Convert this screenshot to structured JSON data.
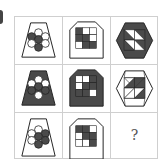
{
  "puzzle": {
    "type": "3x3 figure reasoning matrix",
    "colors": {
      "dark": "#4a4a4a",
      "light": "#ffffff",
      "stroke": "#222222",
      "grid_line": "#cfcfcf"
    },
    "rows": [
      [
        {
          "shape": "trapezoid",
          "outer_fill": "light",
          "inner": "flower-7-circles",
          "dark_circles": [
            "top-left",
            "center",
            "bottom-left"
          ]
        },
        {
          "shape": "house-pentagon",
          "outer_fill": "light",
          "inner": "3x3-squares",
          "dark_cells": [
            0,
            3,
            4,
            7
          ]
        },
        {
          "shape": "hexagon",
          "outer_fill": "dark",
          "inner": "square-of-triangles",
          "dark_triangles": "mixed"
        }
      ],
      [
        {
          "shape": "trapezoid",
          "outer_fill": "dark",
          "inner": "flower-7-circles",
          "dark_circles": [
            "center",
            "bottom-left",
            "bottom-right"
          ]
        },
        {
          "shape": "house-pentagon",
          "outer_fill": "dark",
          "inner": "3x3-squares",
          "dark_cells": [
            2,
            4,
            5,
            6,
            7
          ]
        },
        {
          "shape": "hexagon",
          "outer_fill": "light",
          "inner": "square-of-triangles",
          "dark_triangles": "mixed"
        }
      ],
      [
        {
          "shape": "trapezoid",
          "outer_fill": "light",
          "inner": "flower-7-circles",
          "dark_circles": [
            "top-right",
            "center",
            "right",
            "bottom-right"
          ]
        },
        {
          "shape": "house-pentagon",
          "outer_fill": "light",
          "inner": "3x3-squares",
          "dark_cells": [
            0,
            1,
            4,
            5,
            8
          ]
        },
        {
          "shape": "unknown",
          "label": "?"
        }
      ]
    ]
  }
}
